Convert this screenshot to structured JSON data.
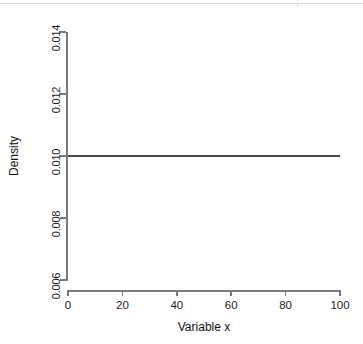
{
  "figure": {
    "background_color": "#ffffff",
    "axis_color": "#7a7a7a",
    "line_color": "#4a4a4a",
    "top_rule_color": "#d8d8d8"
  },
  "chart_data": {
    "type": "line",
    "title": "",
    "subtitle": "",
    "xlabel": "Variable x",
    "ylabel": "Density",
    "xlim": [
      0,
      100
    ],
    "ylim": [
      0.006,
      0.014
    ],
    "xticks": [
      0,
      20,
      40,
      60,
      80,
      100
    ],
    "xtick_labels": [
      "0",
      "20",
      "40",
      "60",
      "80",
      "100"
    ],
    "yticks": [
      0.006,
      0.008,
      0.01,
      0.012,
      0.014
    ],
    "ytick_labels": [
      "0.006",
      "0.008",
      "0.010",
      "0.012",
      "0.014"
    ],
    "grid": false,
    "legend": null,
    "legend_position": "none",
    "annotations": [],
    "series": [
      {
        "name": "Uniform density",
        "x": [
          0,
          10,
          20,
          30,
          40,
          50,
          60,
          70,
          80,
          90,
          100
        ],
        "values": [
          0.01,
          0.01,
          0.01,
          0.01,
          0.01,
          0.01,
          0.01,
          0.01,
          0.01,
          0.01,
          0.01
        ]
      }
    ]
  }
}
